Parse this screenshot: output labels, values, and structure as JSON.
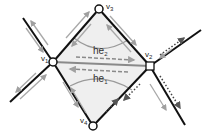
{
  "diagram": {
    "type": "half-edge mesh illustration",
    "vertices": [
      {
        "id": "v1",
        "label": "v",
        "sub": "1",
        "x": 53,
        "y": 62,
        "shape": "circle"
      },
      {
        "id": "v2",
        "label": "v",
        "sub": "2",
        "x": 150,
        "y": 66,
        "shape": "square"
      },
      {
        "id": "v3",
        "label": "v",
        "sub": "3",
        "x": 99,
        "y": 9,
        "shape": "circle"
      },
      {
        "id": "v4",
        "label": "v",
        "sub": "4",
        "x": 93,
        "y": 126,
        "shape": "circle"
      }
    ],
    "half_edges": [
      {
        "id": "he2",
        "label": "he",
        "sub": "2",
        "direction": "v1 → v2"
      },
      {
        "id": "he1",
        "label": "he",
        "sub": "1",
        "direction": "v2 → v1"
      }
    ],
    "colors": {
      "edge": "#111111",
      "half_edge_arrow": "#999999",
      "face_fill": "#ececec",
      "dotted_arrow": "#444444"
    }
  }
}
